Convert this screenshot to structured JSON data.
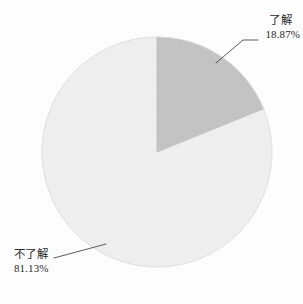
{
  "chart_data": {
    "type": "pie",
    "title": "",
    "subtitle": "",
    "xlabel": "",
    "ylabel": "",
    "legend_position": "none",
    "grid": false,
    "start_angle_deg": 0,
    "direction": "clockwise",
    "categories": [
      "了解",
      "不了解"
    ],
    "values": [
      18.87,
      81.13
    ],
    "value_unit": "%",
    "slices": [
      {
        "label": "了解",
        "value": 18.87,
        "value_text": "18.87%",
        "color": "#c3c3c3",
        "start_angle_deg": 0,
        "end_angle_deg": 67.93
      },
      {
        "label": "不了解",
        "value": 81.13,
        "value_text": "81.13%",
        "color": "#efefef",
        "start_angle_deg": 67.93,
        "end_angle_deg": 360
      }
    ],
    "annotations": [
      {
        "label": "了解",
        "value_text": "18.87%",
        "position": "top-right",
        "leader_line": true
      },
      {
        "label": "不了解",
        "value_text": "81.13%",
        "position": "bottom-left",
        "leader_line": true
      }
    ]
  },
  "figure": {
    "background_color": "#fdfdfd",
    "slice_known_color": "#c3c3c3",
    "slice_unknown_color": "#efefef",
    "outline_color": "#dcdcdc",
    "leader_color": "#4a4a4a",
    "text_color": "#2b2b2b"
  },
  "labels": {
    "known": {
      "name": "了解",
      "value": "18.87%"
    },
    "unknown": {
      "name": "不了解",
      "value": "81.13%"
    }
  }
}
